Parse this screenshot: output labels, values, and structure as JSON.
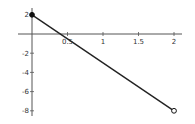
{
  "chart_data": {
    "type": "line",
    "title": "",
    "xlabel": "",
    "ylabel": "",
    "xlim": [
      -0.05,
      2.1
    ],
    "ylim": [
      -8.4,
      2.3
    ],
    "grid": false,
    "legend": null,
    "x_ticks": [
      0.5,
      1,
      1.5,
      2
    ],
    "x_tick_labels": [
      "0.5",
      "1",
      "1.5",
      "2"
    ],
    "y_ticks": [
      2,
      -2,
      -4,
      -6,
      -8
    ],
    "y_tick_labels": [
      "2",
      "-2",
      "-4",
      "-6",
      "-8"
    ],
    "series": [
      {
        "name": "line",
        "x": [
          0,
          2
        ],
        "y": [
          2,
          -8
        ],
        "color": "#222222"
      }
    ],
    "markers": [
      {
        "x": 0,
        "y": 2,
        "style": "filled"
      },
      {
        "x": 2,
        "y": -8,
        "style": "open"
      }
    ]
  },
  "layout": {
    "origin_px": [
      32,
      34
    ],
    "px_per_x": 71,
    "px_per_y": 9.6
  }
}
